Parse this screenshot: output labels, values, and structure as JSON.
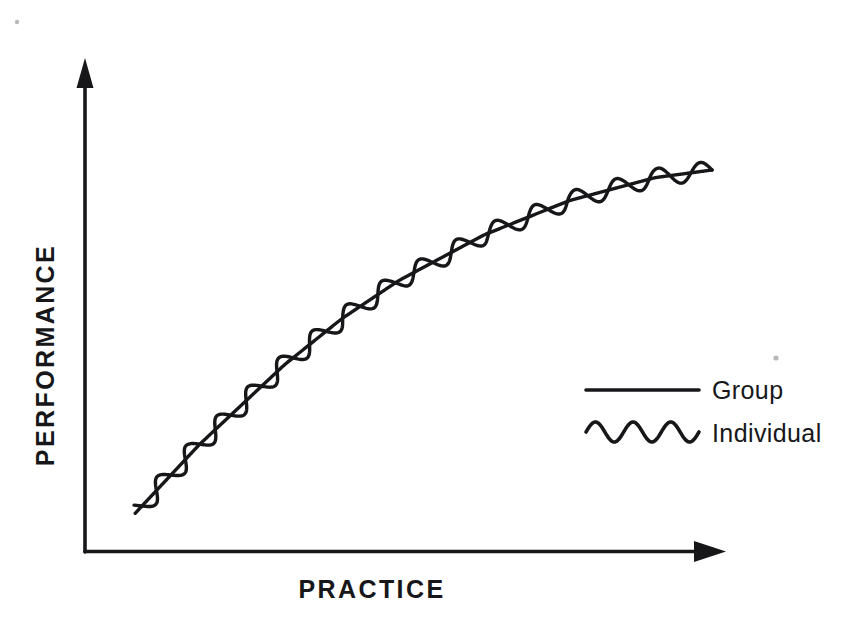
{
  "figure": {
    "background_color": "#ffffff",
    "ink_color": "#17171a",
    "axes": {
      "y_axis_label": "PERFORMANCE",
      "x_axis_label": "PRACTICE",
      "y_axis_name": "y-axis-arrow",
      "x_axis_name": "x-axis-arrow",
      "has_tick_labels": false,
      "has_gridlines": false
    },
    "legend": {
      "position": "bottom-right",
      "entries": [
        {
          "label": "Group",
          "sample": "straight-line",
          "color": "#17171a"
        },
        {
          "label": "Individual",
          "sample": "wavy-line",
          "color": "#17171a"
        }
      ]
    }
  },
  "chart_data": {
    "type": "line",
    "title": "",
    "subtitle": "",
    "xlabel": "PRACTICE",
    "ylabel": "PERFORMANCE",
    "xlim": [
      0,
      100
    ],
    "ylim": [
      0,
      100
    ],
    "grid": false,
    "legend_position": "bottom-right",
    "axis_ticks_shown": false,
    "series": [
      {
        "name": "Group",
        "style": "smooth-line",
        "color": "#17171a",
        "x": [
          0,
          5,
          10,
          15,
          20,
          25,
          30,
          35,
          40,
          45,
          50,
          55,
          60,
          65,
          70,
          75,
          80,
          85,
          90,
          95,
          100
        ],
        "values": [
          5,
          13,
          21,
          28,
          35,
          42,
          48,
          54,
          59,
          64,
          68,
          72,
          76,
          79,
          82,
          85,
          87,
          89,
          91,
          92,
          93
        ]
      },
      {
        "name": "Individual",
        "style": "wavy-line",
        "color": "#17171a",
        "description": "Sinusoidal oscillation of roughly constant amplitude around the Group curve, about 16 full cycles across the practice range.",
        "oscillation_cycles": 16,
        "x": [
          0,
          5,
          10,
          15,
          20,
          25,
          30,
          35,
          40,
          45,
          50,
          55,
          60,
          65,
          70,
          75,
          80,
          85,
          90,
          95,
          100
        ],
        "values": [
          5,
          16,
          19,
          31,
          33,
          45,
          46,
          57,
          57,
          67,
          66,
          75,
          74,
          82,
          80,
          88,
          85,
          92,
          89,
          95,
          93
        ]
      }
    ]
  }
}
